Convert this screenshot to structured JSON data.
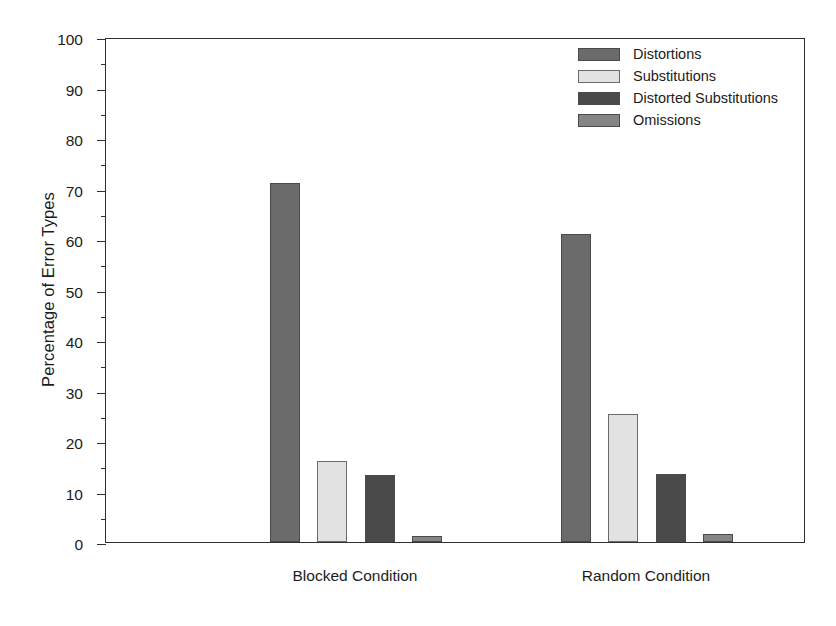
{
  "chart_data": {
    "type": "bar",
    "title": "",
    "xlabel": "",
    "ylabel": "Percentage of Error Types",
    "ylim": [
      0,
      100
    ],
    "ytick_step": 10,
    "yminor_step": 5,
    "grid": false,
    "legend_position": "top-right",
    "categories": [
      "Blocked Condition",
      "Random Condition"
    ],
    "ytick_labels": [
      "0",
      "10",
      "20",
      "30",
      "40",
      "50",
      "60",
      "70",
      "80",
      "90",
      "100"
    ],
    "series": [
      {
        "name": "Distortions",
        "color": "#6b6b6b",
        "values": [
          71,
          61
        ]
      },
      {
        "name": "Substitutions",
        "color": "#e2e2e2",
        "values": [
          16,
          25.3
        ]
      },
      {
        "name": "Distorted Substitutions",
        "color": "#4a4a4a",
        "values": [
          13.2,
          13.5
        ]
      },
      {
        "name": "Omissions",
        "color": "#858585",
        "values": [
          1.2,
          1.5
        ]
      }
    ]
  },
  "legend": {
    "items": [
      {
        "label": "Distortions",
        "color": "#6b6b6b"
      },
      {
        "label": "Substitutions",
        "color": "#e2e2e2"
      },
      {
        "label": "Distorted Substitutions",
        "color": "#4a4a4a"
      },
      {
        "label": "Omissions",
        "color": "#858585"
      }
    ]
  },
  "axis": {
    "y_title": "Percentage of Error Types"
  }
}
